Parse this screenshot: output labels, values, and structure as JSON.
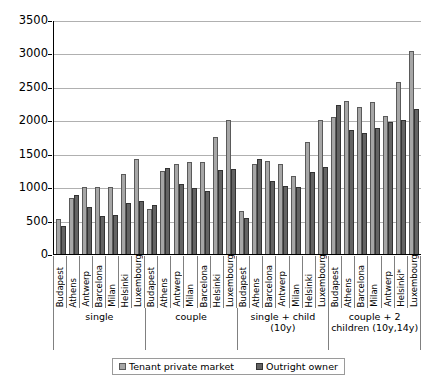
{
  "chart_data": {
    "type": "bar",
    "title": "",
    "xlabel": "",
    "ylabel": "",
    "ylim": [
      0,
      3500
    ],
    "ytick_step": 500,
    "yticks": [
      0,
      500,
      1000,
      1500,
      2000,
      2500,
      3000,
      3500
    ],
    "grid": true,
    "legend_position": "bottom",
    "series": [
      {
        "name": "Tenant private market",
        "color": "#a6a6a6",
        "values": [
          520,
          840,
          1000,
          995,
          995,
          1200,
          1415,
          680,
          1245,
          1340,
          1375,
          1380,
          1750,
          2000,
          640,
          1345,
          1390,
          1345,
          1165,
          1680,
          2000,
          2045,
          2290,
          2200,
          2280,
          2065,
          2580,
          3030
        ]
      },
      {
        "name": "Outright owner",
        "color": "#636363",
        "values": [
          420,
          890,
          700,
          570,
          580,
          770,
          790,
          740,
          1285,
          1050,
          980,
          950,
          1255,
          1265,
          545,
          1420,
          1090,
          1015,
          1000,
          1230,
          1300,
          2230,
          1860,
          1810,
          1880,
          1975,
          2010,
          2165
        ]
      }
    ],
    "groups": [
      {
        "label": "single",
        "categories": [
          "Budapest",
          "Athens",
          "Antwerp",
          "Barcelona",
          "Milan",
          "Helsinki",
          "Luxembourg"
        ]
      },
      {
        "label": "couple",
        "categories": [
          "Budapest",
          "Athens",
          "Antwerp",
          "Milan",
          "Barcelona",
          "Helsinki",
          "Luxembourg"
        ]
      },
      {
        "label": "single + child (10y)",
        "categories": [
          "Budapest",
          "Athens",
          "Barcelona",
          "Antwerp",
          "Milan",
          "Helsinki",
          "Luxembourg"
        ]
      },
      {
        "label": "couple + 2 children (10y,14y)",
        "categories": [
          "Budapest",
          "Athens",
          "Barcelona",
          "Milan",
          "Antwerp",
          "Helsinki*",
          "Luxembourg"
        ]
      }
    ]
  },
  "legend": {
    "items": [
      {
        "label": "Tenant private market",
        "swatch": "tenant-swatch"
      },
      {
        "label": "Outright owner",
        "swatch": "owner-swatch"
      }
    ]
  }
}
